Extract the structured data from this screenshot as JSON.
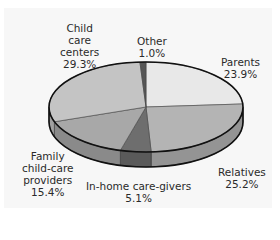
{
  "chart_data": {
    "type": "pie",
    "style": "3d",
    "title": "",
    "start_angle": "12 o'clock",
    "direction": "clockwise",
    "slices": [
      {
        "label": "Parents",
        "value": 23.9,
        "display": "23.9%",
        "color": "#e8e8e8"
      },
      {
        "label": "Relatives",
        "value": 25.2,
        "display": "25.2%",
        "color": "#b4b4b4"
      },
      {
        "label": "In-home care-givers",
        "value": 5.1,
        "display": "5.1%",
        "color": "#6e6e6e"
      },
      {
        "label": "Family child-care providers",
        "value": 15.4,
        "display": "15.4%",
        "color": "#a8a8a8"
      },
      {
        "label": "Child care centers",
        "value": 29.3,
        "display": "29.3%",
        "color": "#c4c4c4"
      },
      {
        "label": "Other",
        "value": 1.0,
        "display": "1.0%",
        "color": "#555555"
      }
    ],
    "legend": "none (direct labels)"
  },
  "labels": {
    "parents": {
      "lines": [
        "Parents"
      ],
      "pct": "23.9%"
    },
    "relatives": {
      "lines": [
        "Relatives"
      ],
      "pct": "25.2%"
    },
    "inhome": {
      "lines": [
        "In-home care-givers"
      ],
      "pct": "5.1%"
    },
    "family": {
      "lines": [
        "Family",
        "child-care",
        "providers"
      ],
      "pct": "15.4%"
    },
    "childcare": {
      "lines": [
        "Child",
        "care",
        "centers"
      ],
      "pct": "29.3%"
    },
    "other": {
      "lines": [
        "Other"
      ],
      "pct": "1.0%"
    }
  }
}
